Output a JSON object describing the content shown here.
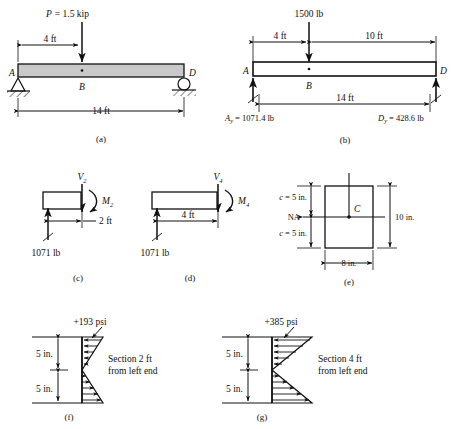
{
  "figure": {
    "panels": [
      "(a)",
      "(b)",
      "(c)",
      "(d)",
      "(e)",
      "(f)",
      "(g)"
    ]
  },
  "panel_a": {
    "label": "(a)",
    "load": "P = 1.5 kip",
    "load_symbol": "P",
    "load_value": "= 1.5 kip",
    "dim_left": "4 ft",
    "dim_span": "14 ft",
    "point_a": "A",
    "point_b": "B",
    "point_d": "D",
    "support_a": "pin-support",
    "support_d": "roller-support",
    "beam_fill": "#c9c9c9"
  },
  "panel_b": {
    "label": "(b)",
    "load": "1500 lb",
    "dim_left": "4 ft",
    "dim_right": "10 ft",
    "dim_span": "14 ft",
    "point_a": "A",
    "point_b": "B",
    "point_d": "D",
    "reaction_a_sym": "A",
    "reaction_a_sub": "y",
    "reaction_a_val": "= 1071.4 lb",
    "reaction_d_sym": "D",
    "reaction_d_sub": "y",
    "reaction_d_val": "= 428.6 lb"
  },
  "panel_c": {
    "label": "(c)",
    "shear_sym": "V",
    "shear_sub": "2",
    "moment_sym": "M",
    "moment_sub": "2",
    "dim": "2 ft",
    "reaction": "1071 lb"
  },
  "panel_d": {
    "label": "(d)",
    "shear_sym": "V",
    "shear_sub": "4",
    "moment_sym": "M",
    "moment_sub": "4",
    "dim": "4 ft",
    "reaction": "1071 lb"
  },
  "panel_e": {
    "label": "(e)",
    "c_top": "c = 5 in.",
    "c_bottom": "c = 5 in.",
    "na": "NA",
    "centroid": "C",
    "height": "10 in.",
    "width": "8 in."
  },
  "panel_f": {
    "label": "(f)",
    "stress": "+193 psi",
    "dim_top": "5 in.",
    "dim_bottom": "5 in.",
    "caption_line1": "Section 2 ft",
    "caption_line2": "from left end"
  },
  "panel_g": {
    "label": "(g)",
    "stress": "+385 psi",
    "dim_top": "5 in.",
    "dim_bottom": "5 in.",
    "caption_line1": "Section 4 ft",
    "caption_line2": "from left end"
  }
}
